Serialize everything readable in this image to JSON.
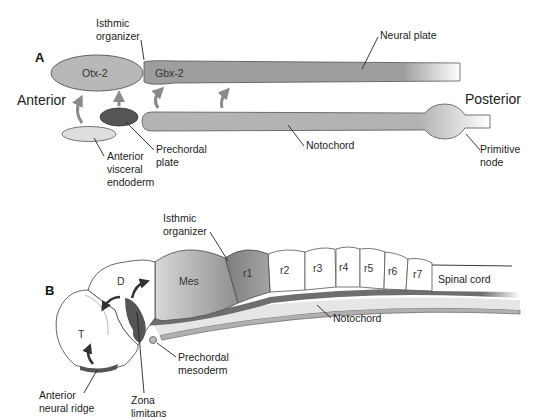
{
  "figure": {
    "panel_a": {
      "panel_label": "A",
      "orientation": {
        "left": "Anterior",
        "right": "Posterior"
      },
      "regions": {
        "otx2": "Otx-2",
        "gbx2": "Gbx-2"
      },
      "labels": {
        "isthmic_organizer_1": "Isthmic",
        "isthmic_organizer_2": "organizer",
        "neural_plate": "Neural plate",
        "notochord": "Notochord",
        "primitive_node_1": "Primitive",
        "primitive_node_2": "node",
        "prechordal_plate_1": "Prechordal",
        "prechordal_plate_2": "plate",
        "ave_1": "Anterior",
        "ave_2": "visceral",
        "ave_3": "endoderm"
      }
    },
    "panel_b": {
      "panel_label": "B",
      "regions": {
        "t": "T",
        "d": "D",
        "mes": "Mes",
        "r1": "r1",
        "r2": "r2",
        "r3": "r3",
        "r4": "r4",
        "r5": "r5",
        "r6": "r6",
        "r7": "r7",
        "spinal_cord": "Spinal cord"
      },
      "labels": {
        "isthmic_organizer_1": "Isthmic",
        "isthmic_organizer_2": "organizer",
        "notochord": "Notochord",
        "prechordal_mesoderm_1": "Prechordal",
        "prechordal_mesoderm_2": "mesoderm",
        "anr_1": "Anterior",
        "anr_2": "neural ridge",
        "zona_1": "Zona",
        "zona_2": "limitans"
      }
    },
    "colors": {
      "otx2": "#b8b8b8",
      "gbx2": "#9e9e9e",
      "notochord": "#b3b3b3",
      "prechordal_plate": "#555555",
      "ave": "#dedede",
      "arrow": "#8a8a8a",
      "dark_arrow": "#333333",
      "mes": "#a8a8a8",
      "r1": "#8c8c8c",
      "floor": "#6e6e6e",
      "outline": "#555555"
    }
  }
}
